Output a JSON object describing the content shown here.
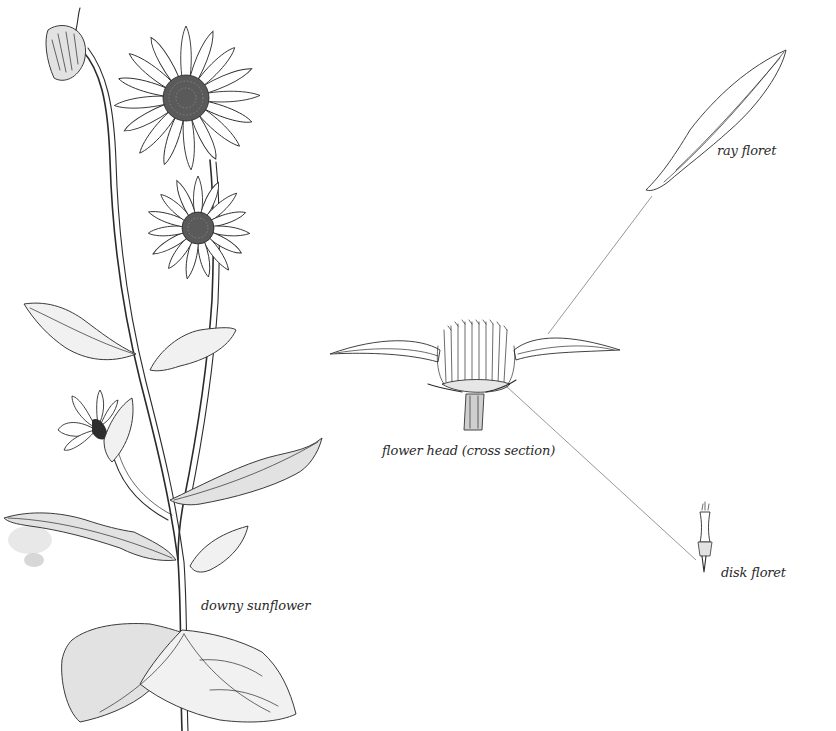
{
  "illustration": {
    "subject": "downy sunflower",
    "style": "black and white pen-and-ink botanical illustration",
    "background_color": "#ffffff",
    "ink_color": "#2b2b2b"
  },
  "labels": {
    "plant": "downy sunflower",
    "flower_head": "flower head (cross section)",
    "ray_floret": "ray floret",
    "disk_floret": "disk floret"
  },
  "parts": [
    {
      "name": "downy sunflower",
      "description": "full plant with bud, two open flower heads, side flower and leaves"
    },
    {
      "name": "flower head (cross section)",
      "description": "cut head showing disk florets and two ray florets"
    },
    {
      "name": "ray floret",
      "description": "single elongated ray petal, connected by leader line to cross section"
    },
    {
      "name": "disk floret",
      "description": "single tubular disk floret, connected by leader line to cross section"
    }
  ]
}
